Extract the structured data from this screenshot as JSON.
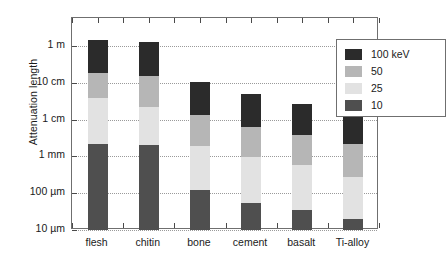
{
  "chart_data": {
    "type": "bar",
    "stacked": true,
    "title": "",
    "xlabel": "",
    "ylabel": "Attenuation length",
    "categories": [
      "flesh",
      "chitin",
      "bone",
      "cement",
      "basalt",
      "Ti-alloy"
    ],
    "legend_position": "top-right",
    "grid": true,
    "y_scale": "log",
    "y_unit_note": "values in metres",
    "ylim": [
      1e-05,
      3.0
    ],
    "y_ticks": [
      {
        "label": "1 m",
        "value": 1.0
      },
      {
        "label": "10 cm",
        "value": 0.1
      },
      {
        "label": "1 cm",
        "value": 0.01
      },
      {
        "label": "1 mm",
        "value": 0.001
      },
      {
        "label": "100 µm",
        "value": 0.0001
      },
      {
        "label": "10 µm",
        "value": 1e-05
      }
    ],
    "series": [
      {
        "name": "100 keV",
        "color": "#2b2b2b",
        "values": [
          1.45,
          1.25,
          0.102,
          0.048,
          0.027,
          0.017
        ]
      },
      {
        "name": "50",
        "color": "#b6b6b6",
        "values": [
          0.185,
          0.155,
          0.0135,
          0.0063,
          0.0037,
          0.0022
        ]
      },
      {
        "name": "25",
        "color": "#e2e2e2",
        "values": [
          0.039,
          0.022,
          0.00185,
          0.00098,
          0.00056,
          0.00027
        ]
      },
      {
        "name": "10",
        "color": "#4f4f4f",
        "values": [
          0.0022,
          0.002,
          0.000118,
          5.5e-05,
          3.5e-05,
          1.95e-05
        ]
      }
    ],
    "baseline": 1e-05
  },
  "legend": {
    "entries": [
      {
        "label": "100 keV",
        "color": "#2b2b2b"
      },
      {
        "label": "50",
        "color": "#b6b6b6"
      },
      {
        "label": "25",
        "color": "#e2e2e2"
      },
      {
        "label": "10",
        "color": "#4f4f4f"
      }
    ]
  }
}
